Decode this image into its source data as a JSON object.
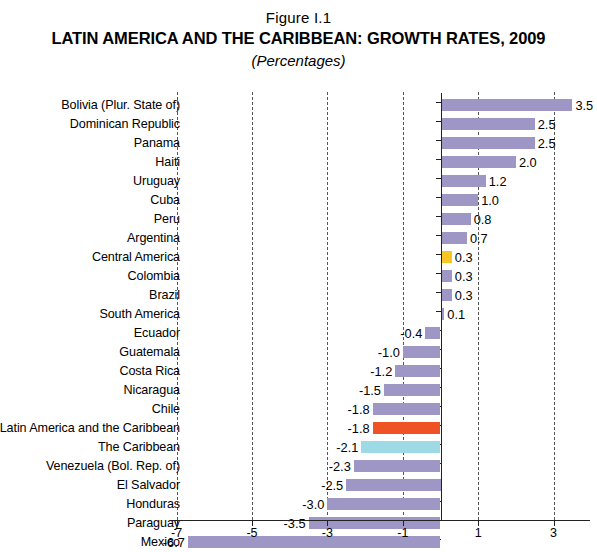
{
  "figure": {
    "number": "Figure I.1",
    "title": "LATIN AMERICA AND THE CARIBBEAN: GROWTH RATES, 2009",
    "subtitle": "(Percentages)"
  },
  "colors": {
    "bar_default": "#9e97c6",
    "bar_highlight_region": "#ee5225",
    "bar_caribbean": "#9ed9e6",
    "bar_central_america": "#f7c524",
    "axis": "#222222",
    "gridline": "#555555"
  },
  "chart_data": {
    "type": "bar",
    "orientation": "horizontal",
    "title": "LATIN AMERICA AND THE CARIBBEAN: GROWTH RATES, 2009",
    "subtitle": "(Percentages)",
    "xlabel": "",
    "ylabel": "",
    "xlim": [
      -7,
      4
    ],
    "xticks": [
      -7,
      -5,
      -3,
      -1,
      1,
      3
    ],
    "xticklabels": [
      "-7",
      "-5",
      "-3",
      "-1",
      "1",
      "3"
    ],
    "grid": true,
    "legend": "none",
    "categories": [
      "Bolivia (Plur. State of)",
      "Dominican Republic",
      "Panama",
      "Haiti",
      "Uruguay",
      "Cuba",
      "Peru",
      "Argentina",
      "Central America",
      "Colombia",
      "Brazil",
      "South America",
      "Ecuador",
      "Guatemala",
      "Costa Rica",
      "Nicaragua",
      "Chile",
      "Latin America and the Caribbean",
      "The Caribbean",
      "Venezuela (Bol. Rep. of)",
      "El Salvador",
      "Honduras",
      "Paraguay",
      "Mexico"
    ],
    "values": [
      3.5,
      2.5,
      2.5,
      2.0,
      1.2,
      1.0,
      0.8,
      0.7,
      0.3,
      0.3,
      0.3,
      0.1,
      -0.4,
      -1.0,
      -1.2,
      -1.5,
      -1.8,
      -1.8,
      -2.1,
      -2.3,
      -2.5,
      -3.0,
      -3.5,
      -6.7
    ],
    "value_labels": [
      "3.5",
      "2.5",
      "2.5",
      "2.0",
      "1.2",
      "1.0",
      "0.8",
      "0.7",
      "0.3",
      "0.3",
      "0.3",
      "0.1",
      "-0.4",
      "-1.0",
      "-1.2",
      "-1.5",
      "-1.8",
      "-1.8",
      "-2.1",
      "-2.3",
      "-2.5",
      "-3.0",
      "-3.5",
      "-6.7"
    ],
    "bar_colors": [
      "#9e97c6",
      "#9e97c6",
      "#9e97c6",
      "#9e97c6",
      "#9e97c6",
      "#9e97c6",
      "#9e97c6",
      "#9e97c6",
      "#f7c524",
      "#9e97c6",
      "#9e97c6",
      "#9e97c6",
      "#9e97c6",
      "#9e97c6",
      "#9e97c6",
      "#9e97c6",
      "#9e97c6",
      "#ee5225",
      "#9ed9e6",
      "#9e97c6",
      "#9e97c6",
      "#9e97c6",
      "#9e97c6",
      "#9e97c6"
    ]
  }
}
